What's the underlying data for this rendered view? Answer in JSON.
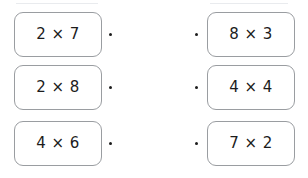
{
  "worksheet": {
    "title": "Multiplication matching exercise",
    "decor": {
      "top_rule_left": "",
      "top_rule_right": ""
    },
    "rows": [
      {
        "left": {
          "expression": "2 × 7"
        },
        "right": {
          "expression": "8 × 3"
        }
      },
      {
        "left": {
          "expression": "2 × 8"
        },
        "right": {
          "expression": "4 × 4"
        }
      },
      {
        "left": {
          "expression": "4 × 6"
        },
        "right": {
          "expression": "7 × 2"
        }
      }
    ],
    "connector": {
      "left_dot_icon": "connector-dot",
      "right_dot_icon": "connector-dot"
    },
    "colors": {
      "card_border": "#9a9da1",
      "card_fill": "#ffffff",
      "text": "#1c1c1c",
      "page_background": "#ffffff"
    }
  }
}
